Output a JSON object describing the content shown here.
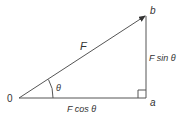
{
  "diagram": {
    "type": "vector-resolution",
    "labels": {
      "origin": "0",
      "vector": "F",
      "angle": "θ",
      "point_a": "a",
      "point_b": "b",
      "horizontal_component": "F cos θ",
      "vertical_component": "F sin θ"
    },
    "colors": {
      "line": "#555555",
      "text": "#333333"
    }
  }
}
